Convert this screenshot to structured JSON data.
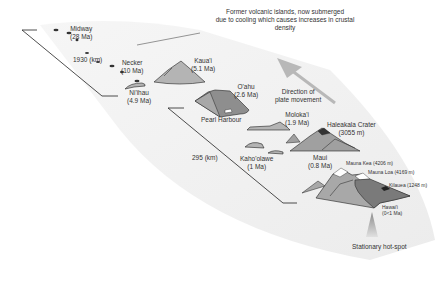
{
  "title_note": {
    "line1": "Former volcanic islands, now submerged",
    "line2": "due to cooling which causes increases in crustal",
    "line3": "density"
  },
  "islands": [
    {
      "name": "Midway",
      "age": "(28 Ma)"
    },
    {
      "name": "Necker",
      "age": "(10 Ma)"
    },
    {
      "name": "Kaua'i",
      "age": "(5.1 Ma)"
    },
    {
      "name": "Ni'ihau",
      "age": "(4.9 Ma)"
    },
    {
      "name": "O'ahu",
      "age": "(2.6 Ma)"
    },
    {
      "name": "Moloka'i",
      "age": "(1.9 Ma)"
    },
    {
      "name": "Kaho'olawe",
      "age": "(1 Ma)"
    },
    {
      "name": "Maui",
      "age": "(0.8 Ma)"
    },
    {
      "name": "Hawai'i",
      "age": "(0<1 Ma)"
    }
  ],
  "features": {
    "pearl_harbour": "Pearl Harbour",
    "haleakala": "Haleakala Crater",
    "haleakala_height": "(3055 m)",
    "mauna_kea": "Mauna Kea (4206 m)",
    "mauna_loa": "Mauna Loa (4169 m)",
    "kilauea": "Kilauea (1248 m)"
  },
  "distances": {
    "long": "1930 (km)",
    "short": "295 (km)"
  },
  "plate_arrow": {
    "line1": "Direction of",
    "line2": "plate movement"
  },
  "hotspot": "Stationary hot-spot",
  "colors": {
    "island_light": "#b4b4b4",
    "island_mid": "#9a9a9a",
    "island_dark": "#7a7a7a",
    "arrow": "#b8b8b8",
    "plate": "#f2f2f2",
    "line": "#222222"
  }
}
